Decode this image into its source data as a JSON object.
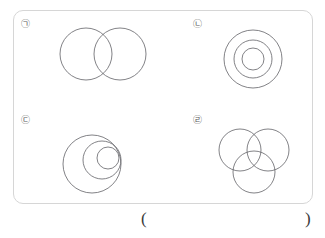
{
  "page": {
    "background_color": "#ffffff",
    "stroke_color": "#6b6b70",
    "box_border_color": "#d6d6d6",
    "label_color": "#595959",
    "width": 325,
    "height": 238
  },
  "figure_box": {
    "name": "figure-panel",
    "border_radius": 10
  },
  "quadrants": [
    {
      "id": "a",
      "label": "㉠",
      "label_plain": "(ㄱ)",
      "description": "two equal circles overlapping side by side",
      "circle_count": 2,
      "circles": [
        {
          "cx": 86,
          "cy": 54,
          "r": 26
        },
        {
          "cx": 120,
          "cy": 54,
          "r": 26
        }
      ]
    },
    {
      "id": "b",
      "label": "㉡",
      "label_plain": "(ㄴ)",
      "description": "three concentric circles sharing one center",
      "circle_count": 3,
      "circles": [
        {
          "cx": 253,
          "cy": 59,
          "r": 29
        },
        {
          "cx": 253,
          "cy": 59,
          "r": 19
        },
        {
          "cx": 253,
          "cy": 59,
          "r": 11
        }
      ]
    },
    {
      "id": "c",
      "label": "㉢",
      "label_plain": "(ㄷ)",
      "description": "three nested circles internally tangent on the right side",
      "circle_count": 3,
      "circles": [
        {
          "cx": 92,
          "cy": 164,
          "r": 29
        },
        {
          "cx": 102,
          "cy": 160,
          "r": 19
        },
        {
          "cx": 108,
          "cy": 158,
          "r": 11
        }
      ]
    },
    {
      "id": "d",
      "label": "㉣",
      "label_plain": "(ㄹ)",
      "description": "three equal circles overlapping in a triangular arrangement",
      "circle_count": 3,
      "circles": [
        {
          "cx": 240,
          "cy": 150,
          "r": 21
        },
        {
          "cx": 268,
          "cy": 150,
          "r": 21
        },
        {
          "cx": 254,
          "cy": 172,
          "r": 21
        }
      ]
    }
  ],
  "answer": {
    "open_paren": "(",
    "close_paren": ")",
    "value": ""
  }
}
